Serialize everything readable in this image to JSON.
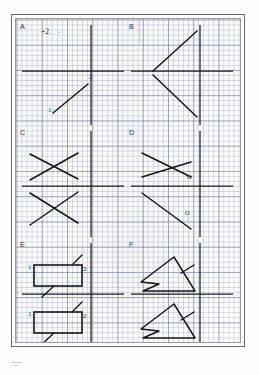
{
  "document": {
    "type": "scanned-worksheet",
    "medium": "graph paper",
    "page_width": 259,
    "page_height": 375,
    "ink_color": "#1d1d1d",
    "grid_color": "#7882a5",
    "frame_color": "#6a6a6a",
    "paper_color": "#fefefe"
  },
  "grid": {
    "minor_spacing_px": 5.05,
    "major_spacing_px": 25.25,
    "visible": true
  },
  "panels": [
    {
      "id": "A",
      "label": "A",
      "label_x": 8,
      "label_y": 6,
      "annotations": [
        {
          "text": "+2",
          "x": 21,
          "y": 5,
          "name": "plus-two-annotation"
        }
      ],
      "smudge": {
        "x": 38,
        "y": 9
      },
      "axes": {
        "x_axis_y": 48,
        "y_axis_x": 71
      },
      "figures": [
        {
          "name": "segment-1-2",
          "kind": "segment",
          "points": [
            [
              33,
              90
            ],
            [
              68,
              61
            ]
          ],
          "endpoint_labels": [
            {
              "text": "1",
              "x": 28,
              "y": 87
            },
            {
              "text": "2",
              "x": 69,
              "y": 53
            }
          ]
        }
      ]
    },
    {
      "id": "B",
      "label": "B",
      "label_x": 8,
      "label_y": 6,
      "annotations": [],
      "axes": {
        "x_axis_y": 48,
        "y_axis_x": 71
      },
      "figures": [
        {
          "name": "chevron-upper-arm",
          "kind": "segment",
          "points": [
            [
              24,
              48
            ],
            [
              68,
              8
            ]
          ]
        },
        {
          "name": "chevron-lower-arm",
          "kind": "segment",
          "points": [
            [
              24,
              52
            ],
            [
              68,
              94
            ]
          ]
        }
      ]
    },
    {
      "id": "C",
      "label": "C",
      "label_x": 8,
      "label_y": 6,
      "annotations": [],
      "axes": {
        "x_axis_y": 57,
        "y_axis_x": 71
      },
      "figures": [
        {
          "name": "cross-upper-stroke-a",
          "kind": "segment",
          "points": [
            [
              10,
              25
            ],
            [
              58,
              50
            ]
          ]
        },
        {
          "name": "cross-upper-stroke-b",
          "kind": "segment",
          "points": [
            [
              10,
              51
            ],
            [
              58,
              24
            ]
          ]
        },
        {
          "name": "cross-lower-stroke-a",
          "kind": "segment",
          "points": [
            [
              10,
              64
            ],
            [
              58,
              94
            ]
          ]
        },
        {
          "name": "cross-lower-stroke-b",
          "kind": "segment",
          "points": [
            [
              10,
              96
            ],
            [
              58,
              63
            ]
          ]
        }
      ]
    },
    {
      "id": "D",
      "label": "D",
      "label_x": 8,
      "label_y": 6,
      "annotations": [
        {
          "text": "O",
          "x": 58,
          "y": 48,
          "name": "origin-marker-upper"
        },
        {
          "text": "O",
          "x": 56,
          "y": 84,
          "name": "origin-marker-lower"
        }
      ],
      "axes": {
        "x_axis_y": 57,
        "y_axis_x": 71
      },
      "figures": [
        {
          "name": "skew-cross-stroke-a",
          "kind": "segment",
          "points": [
            [
              13,
              24
            ],
            [
              62,
              48
            ]
          ]
        },
        {
          "name": "skew-cross-stroke-b",
          "kind": "segment",
          "points": [
            [
              13,
              48
            ],
            [
              62,
              33
            ]
          ]
        },
        {
          "name": "diagonal-lower",
          "kind": "segment",
          "points": [
            [
              13,
              64
            ],
            [
              62,
              100
            ]
          ]
        }
      ]
    },
    {
      "id": "E",
      "label": "E",
      "label_x": 8,
      "label_y": 6,
      "annotations": [],
      "axes": {
        "x_axis_y": 53,
        "y_axis_x": 71
      },
      "figures": [
        {
          "name": "rectangle-upper",
          "kind": "rect",
          "x": 14,
          "y": 24,
          "w": 48,
          "h": 21,
          "vertex_labels": [
            {
              "text": "1",
              "x": 9,
              "y": 26
            },
            {
              "text": "2",
              "x": 64,
              "y": 28
            }
          ],
          "tick_strokes": [
            [
              [
                53,
                23
              ],
              [
                62,
                14
              ]
            ],
            [
              [
                22,
                56
              ],
              [
                34,
                45
              ]
            ]
          ]
        },
        {
          "name": "rectangle-lower",
          "kind": "rect",
          "x": 14,
          "y": 71,
          "w": 48,
          "h": 21,
          "vertex_labels": [
            {
              "text": "1",
              "x": 9,
              "y": 72
            },
            {
              "text": "2",
              "x": 64,
              "y": 74
            }
          ],
          "tick_strokes": [
            [
              [
                53,
                70
              ],
              [
                62,
                61
              ]
            ],
            [
              [
                22,
                103
              ],
              [
                34,
                92
              ]
            ]
          ]
        }
      ]
    },
    {
      "id": "F",
      "label": "F",
      "label_x": 8,
      "label_y": 6,
      "annotations": [],
      "axes": {
        "x_axis_y": 53,
        "y_axis_x": 71
      },
      "figures": [
        {
          "name": "arrow-triangle-upper",
          "kind": "polyline",
          "points": [
            [
              45,
              16
            ],
            [
              12,
              41
            ],
            [
              30,
              43
            ],
            [
              14,
              50
            ],
            [
              66,
              50
            ],
            [
              45,
              16
            ]
          ],
          "tail_stroke": [
            [
              52,
              32
            ],
            [
              65,
              24
            ]
          ]
        },
        {
          "name": "arrow-triangle-lower",
          "kind": "polyline",
          "points": [
            [
              45,
              63
            ],
            [
              12,
              88
            ],
            [
              30,
              90
            ],
            [
              14,
              97
            ],
            [
              66,
              97
            ],
            [
              45,
              63
            ]
          ],
          "tail_stroke": [
            [
              52,
              79
            ],
            [
              65,
              71
            ]
          ]
        }
      ]
    }
  ]
}
